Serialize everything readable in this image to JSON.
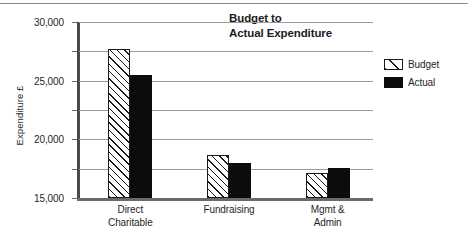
{
  "chart_data": {
    "type": "bar",
    "title": "Budget to\nActual Expenditure",
    "xlabel": "",
    "ylabel": "Expenditure £",
    "ylim": [
      0,
      30000
    ],
    "ytick_labels": [
      "30,000",
      "25,000",
      "20,000",
      "15,000",
      "10,000",
      "5,000",
      "0"
    ],
    "ytick_values": [
      30000,
      25000,
      20000,
      15000,
      10000,
      5000,
      0
    ],
    "grid": true,
    "legend_position": "right",
    "categories": [
      "Direct\nCharitable",
      "Fundraising",
      "Mgmt &\nAdmin"
    ],
    "series": [
      {
        "name": "Budget",
        "values": [
          25400,
          7400,
          4300
        ],
        "fill": "hatched",
        "color": "#1a1a1a"
      },
      {
        "name": "Actual",
        "values": [
          21000,
          6000,
          5200
        ],
        "fill": "solid",
        "color": "#0c0c0c"
      }
    ]
  },
  "legend": {
    "items": [
      {
        "label": "Budget",
        "style": "hatched"
      },
      {
        "label": "Actual",
        "style": "solid"
      }
    ]
  }
}
